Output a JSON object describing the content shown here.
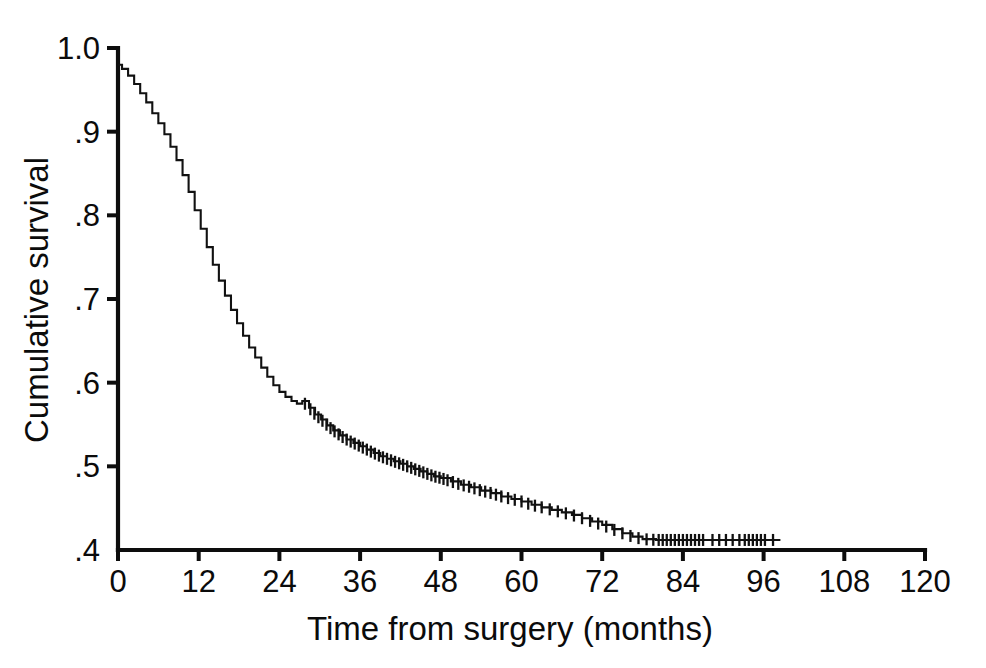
{
  "chart_data": {
    "type": "line",
    "title": "",
    "subtitle": "",
    "xlabel": "Time from surgery (months)",
    "ylabel": "Cumulative survival",
    "xlim": [
      0,
      120
    ],
    "ylim": [
      0.4,
      1.0
    ],
    "xticks": [
      0,
      12,
      24,
      36,
      48,
      60,
      72,
      84,
      96,
      108,
      120
    ],
    "xticklabels": [
      "0",
      "12",
      "24",
      "36",
      "48",
      "60",
      "72",
      "84",
      "96",
      "108",
      "120"
    ],
    "yticks": [
      0.4,
      0.5,
      0.6,
      0.7,
      0.8,
      0.9,
      1.0
    ],
    "yticklabels": [
      ".4",
      ".5",
      ".6",
      ".7",
      ".8",
      ".9",
      "1.0"
    ],
    "grid": false,
    "legend": false,
    "legend_position": "none",
    "series": [
      {
        "name": "Cumulative survival",
        "style": "kaplan-meier-step",
        "color": "#111111",
        "x": [
          0,
          0.6,
          1.5,
          2.4,
          3.3,
          4.2,
          5.1,
          6.0,
          6.9,
          7.8,
          8.7,
          9.6,
          10.5,
          11.4,
          12.3,
          13.2,
          14.1,
          15.0,
          15.9,
          16.8,
          17.7,
          18.6,
          19.5,
          20.4,
          21.3,
          22.2,
          23.1,
          24.0,
          24.9,
          25.8,
          26.6,
          27.4,
          28.4,
          29.3,
          30.2,
          31.1,
          32.0,
          33.0,
          34.0,
          35.0,
          36.0,
          37.0,
          38.0,
          39.0,
          40.0,
          41.0,
          42.0,
          43.0,
          44.0,
          45.0,
          46.0,
          47.0,
          48.0,
          49.5,
          51.0,
          52.5,
          54.0,
          55.5,
          57.0,
          58.5,
          60.0,
          61.5,
          63.0,
          64.5,
          66.0,
          67.5,
          69.0,
          70.5,
          72.0,
          73.5,
          75.0,
          76.5,
          78.0,
          80.0,
          84.0,
          88.0,
          92.0,
          96.0,
          98.5
        ],
        "y": [
          0.98,
          0.975,
          0.967,
          0.957,
          0.946,
          0.935,
          0.922,
          0.91,
          0.897,
          0.882,
          0.866,
          0.848,
          0.828,
          0.806,
          0.784,
          0.762,
          0.741,
          0.722,
          0.704,
          0.687,
          0.671,
          0.656,
          0.642,
          0.63,
          0.618,
          0.607,
          0.597,
          0.589,
          0.583,
          0.578,
          0.575,
          0.578,
          0.57,
          0.562,
          0.556,
          0.549,
          0.543,
          0.537,
          0.532,
          0.528,
          0.524,
          0.52,
          0.516,
          0.512,
          0.509,
          0.506,
          0.503,
          0.5,
          0.497,
          0.494,
          0.491,
          0.488,
          0.486,
          0.482,
          0.478,
          0.475,
          0.471,
          0.468,
          0.464,
          0.461,
          0.458,
          0.454,
          0.451,
          0.448,
          0.445,
          0.442,
          0.438,
          0.434,
          0.43,
          0.425,
          0.42,
          0.416,
          0.413,
          0.412,
          0.412,
          0.412,
          0.412,
          0.412,
          0.412
        ],
        "censor_x": [
          27.8,
          28.6,
          29.2,
          29.8,
          30.4,
          31.0,
          31.6,
          32.2,
          32.8,
          33.4,
          34.0,
          34.6,
          35.2,
          35.8,
          36.4,
          37.0,
          37.6,
          38.2,
          38.8,
          39.4,
          40.0,
          40.6,
          41.2,
          41.8,
          42.4,
          43.0,
          43.6,
          44.2,
          44.8,
          45.4,
          46.0,
          46.6,
          47.2,
          47.8,
          48.4,
          49.0,
          49.8,
          50.6,
          51.4,
          52.2,
          53.0,
          53.8,
          54.6,
          55.4,
          56.2,
          57.0,
          58.0,
          59.0,
          60.0,
          61.0,
          62.0,
          63.0,
          64.2,
          65.4,
          66.6,
          67.8,
          69.0,
          70.2,
          71.4,
          72.6,
          73.8,
          75.0,
          76.2,
          77.4,
          78.6,
          79.6,
          80.4,
          81.0,
          81.6,
          82.2,
          82.8,
          83.4,
          84.0,
          84.6,
          85.2,
          85.8,
          86.4,
          87.0,
          88.4,
          89.4,
          90.4,
          91.4,
          92.4,
          93.2,
          93.8,
          94.4,
          95.0,
          95.6,
          96.2,
          97.4
        ]
      }
    ],
    "annotations": []
  },
  "axis": {
    "y_title": "Cumulative survival",
    "x_title": "Time from surgery (months)"
  }
}
